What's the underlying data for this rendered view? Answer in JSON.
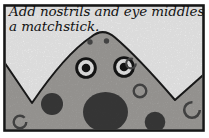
{
  "caption": {
    "line1": "Add nostrils and eye middles with",
    "line2": "a matchstick."
  },
  "illustration": {
    "description": "Cartoon monster head with spotted gray skin, two ringed eyes and two nostril dots, framed in a black comic panel border",
    "features": {
      "nostril_count": "2",
      "eye_count": "2",
      "dark_spot_count": "3",
      "ring_spot_count": "4"
    },
    "colors": {
      "background": "#ffffff",
      "panel_fill": "#fcfcfc",
      "border": "#161616",
      "body": "#a9a7a4",
      "body_outline": "#1c1c1c",
      "nostril": "#4d4d4d",
      "eye_ring": "#171717",
      "eye_white": "#f6f6f6",
      "pupil": "#171717",
      "spot": "#3d3d3d",
      "ring": "#4a4a4a",
      "text": "#131313"
    }
  }
}
